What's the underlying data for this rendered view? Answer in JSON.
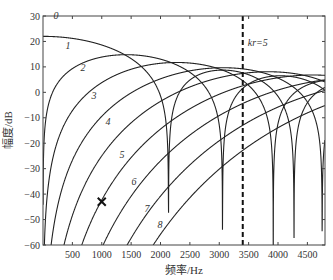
{
  "chart_data": {
    "type": "line",
    "title": "",
    "xlabel": "频率/Hz",
    "ylabel": "幅度/dB",
    "xlim": [
      0,
      4800
    ],
    "ylim": [
      -60,
      30
    ],
    "xticks": [
      500,
      1000,
      1500,
      2000,
      2500,
      3000,
      3500,
      4000,
      4500
    ],
    "yticks": [
      30,
      20,
      10,
      0,
      -10,
      -20,
      -30,
      -40,
      -50,
      -60
    ],
    "grid": false,
    "legend": "inline curve labels",
    "model": {
      "description": "20*log10(|j_n(kr)|) + offset, spherical Bessel functions of order n",
      "offset_db": 22,
      "kr_per_hz": 0.0014706
    },
    "series": [
      {
        "name": "0",
        "order": 0,
        "label_pos": [
          56,
          19
        ]
      },
      {
        "name": "1",
        "order": 1,
        "label_pos": [
          68,
          49
        ]
      },
      {
        "name": "2",
        "order": 2,
        "label_pos": [
          83,
          71
        ]
      },
      {
        "name": "3",
        "order": 3,
        "label_pos": [
          94,
          99
        ]
      },
      {
        "name": "4",
        "order": 4,
        "label_pos": [
          108,
          125
        ]
      },
      {
        "name": "5",
        "order": 5,
        "label_pos": [
          122,
          158
        ]
      },
      {
        "name": "6",
        "order": 6,
        "label_pos": [
          134,
          185
        ]
      },
      {
        "name": "7",
        "order": 7,
        "label_pos": [
          147,
          212
        ]
      },
      {
        "name": "8",
        "order": 8,
        "label_pos": [
          160,
          228
        ]
      }
    ],
    "key_points": {
      "curve0_low_freq_db": 22,
      "curve1_peak_db": 15,
      "nulls_hz": {
        "order0": [
          2135,
          4270
        ],
        "order1": [
          3055
        ],
        "order2": [
          3920
        ]
      }
    },
    "annotations": [
      {
        "type": "vline",
        "x": 3400,
        "style": "dashed",
        "label": "kr=5"
      },
      {
        "type": "marker",
        "symbol": "x",
        "x": 1000,
        "y": -43
      }
    ]
  }
}
